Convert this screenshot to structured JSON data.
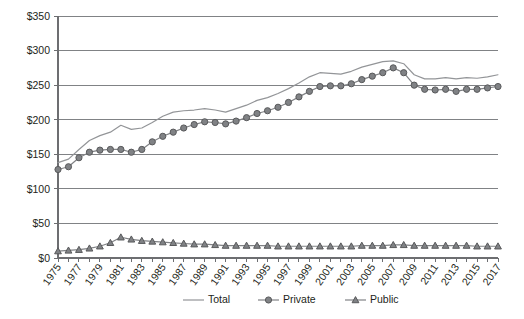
{
  "chart_data": {
    "type": "line",
    "title": "",
    "xlabel": "",
    "ylabel": "",
    "grid": "horizontal",
    "legend_position": "bottom",
    "ylim": [
      0,
      350
    ],
    "ytick_labels": [
      "$0",
      "$50",
      "$100",
      "$150",
      "$200",
      "$250",
      "$300",
      "$350"
    ],
    "ytick_values": [
      0,
      50,
      100,
      150,
      200,
      250,
      300,
      350
    ],
    "xlim": [
      1975,
      2017
    ],
    "x": [
      1975,
      1976,
      1977,
      1978,
      1979,
      1980,
      1981,
      1982,
      1983,
      1984,
      1985,
      1986,
      1987,
      1988,
      1989,
      1990,
      1991,
      1992,
      1993,
      1994,
      1995,
      1996,
      1997,
      1998,
      1999,
      2000,
      2001,
      2002,
      2003,
      2004,
      2005,
      2006,
      2007,
      2008,
      2009,
      2010,
      2011,
      2012,
      2013,
      2014,
      2015,
      2016,
      2017
    ],
    "xtick_labels": [
      "1975",
      "1977",
      "1979",
      "1981",
      "1983",
      "1985",
      "1987",
      "1989",
      "1991",
      "1993",
      "1995",
      "1997",
      "1999",
      "2001",
      "2003",
      "2005",
      "2007",
      "2009",
      "2011",
      "2013",
      "2015",
      "2017"
    ],
    "xtick_values": [
      1975,
      1977,
      1979,
      1981,
      1983,
      1985,
      1987,
      1989,
      1991,
      1993,
      1995,
      1997,
      1999,
      2001,
      2003,
      2005,
      2007,
      2009,
      2011,
      2013,
      2015,
      2017
    ],
    "series": [
      {
        "name": "Total",
        "marker": "none",
        "color": "#939598",
        "values": [
          138,
          143,
          157,
          170,
          177,
          182,
          192,
          186,
          188,
          196,
          205,
          211,
          213,
          214,
          216,
          214,
          211,
          216,
          221,
          228,
          232,
          238,
          245,
          253,
          262,
          268,
          267,
          266,
          270,
          276,
          280,
          284,
          285,
          281,
          265,
          259,
          259,
          261,
          259,
          261,
          260,
          262,
          265
        ]
      },
      {
        "name": "Private",
        "marker": "circle",
        "color": "#808285",
        "values": [
          128,
          132,
          145,
          153,
          156,
          157,
          157,
          153,
          157,
          168,
          176,
          182,
          188,
          193,
          197,
          196,
          194,
          198,
          203,
          209,
          213,
          218,
          225,
          233,
          241,
          248,
          249,
          249,
          252,
          258,
          263,
          268,
          275,
          268,
          250,
          244,
          243,
          244,
          241,
          244,
          244,
          246,
          248
        ]
      },
      {
        "name": "Public",
        "marker": "triangle",
        "color": "#808285",
        "values": [
          10,
          11,
          12,
          14,
          17,
          22,
          30,
          27,
          25,
          24,
          23,
          22,
          21,
          20,
          20,
          19,
          18,
          18,
          18,
          18,
          18,
          17,
          17,
          17,
          17,
          17,
          17,
          17,
          17,
          18,
          18,
          18,
          19,
          19,
          18,
          18,
          18,
          18,
          18,
          18,
          17,
          17,
          17
        ]
      }
    ],
    "legend": [
      {
        "label": "Total",
        "marker": "none"
      },
      {
        "label": "Private",
        "marker": "circle"
      },
      {
        "label": "Public",
        "marker": "triangle"
      }
    ]
  },
  "colors": {
    "total": "#939598",
    "private": "#808285",
    "public": "#808285",
    "grid": "#808285",
    "axis": "#6d6e71",
    "text": "#231f20",
    "background": "#ffffff"
  }
}
